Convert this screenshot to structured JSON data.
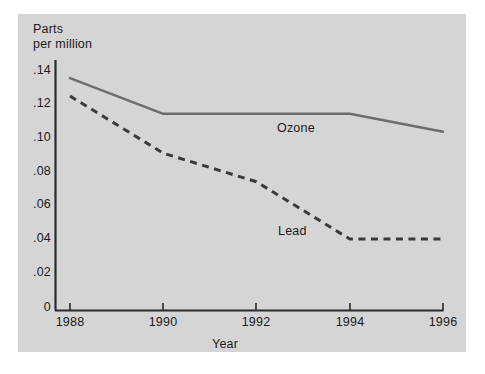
{
  "figure": {
    "background_color": "#ffffff",
    "panel_color": "#d5d5d5",
    "axis_color": "#2b2b2b"
  },
  "axis_titles": {
    "y_line1": "Parts",
    "y_line2": "per million",
    "x": "Year"
  },
  "chart_data": {
    "type": "line",
    "title": "",
    "xlabel": "Year",
    "ylabel": "Parts per million",
    "x": [
      1988,
      1990,
      1992,
      1994,
      1996
    ],
    "xtick_labels": [
      "1988",
      "1990",
      "1992",
      "1994",
      "1996"
    ],
    "xlim": [
      1988,
      1996
    ],
    "ylim": [
      0,
      0.14
    ],
    "ytick_values": [
      0,
      0.02,
      0.04,
      0.06,
      0.08,
      0.1,
      0.12,
      0.14
    ],
    "ytick_labels": [
      "0",
      ".02",
      ".04",
      ".06",
      ".08",
      ".10",
      ".12",
      ".14"
    ],
    "grid": false,
    "legend": "inline-labels",
    "series": [
      {
        "name": "Ozone",
        "style": "solid",
        "color": "#6d6d6d",
        "values": [
          0.13,
          0.11,
          0.11,
          0.11,
          0.1
        ],
        "label_text": "Ozone"
      },
      {
        "name": "Lead",
        "style": "dashed",
        "color": "#3a3a3a",
        "values": [
          0.12,
          0.088,
          0.072,
          0.04,
          0.04
        ],
        "label_text": "Lead"
      }
    ]
  }
}
